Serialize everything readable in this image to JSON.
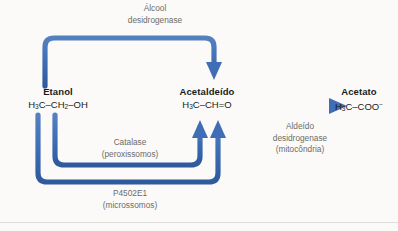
{
  "diagram": {
    "title_alt": "Vias metabolicas do etanol",
    "accent_color": "#3f6eb5",
    "text_color": "#1a1a1a",
    "label_color": "#6d6c68",
    "background_color": "#fbfaf8"
  },
  "nodes": {
    "etanol": {
      "name": "Etanol",
      "formula_parts": [
        "H",
        "3",
        "C–CH",
        "2",
        "–OH"
      ]
    },
    "acetaldeido": {
      "name": "Acetaldeído",
      "formula_parts": [
        "H",
        "3",
        "C–CH=O",
        "",
        ""
      ]
    },
    "acetato": {
      "name": "Acetato",
      "formula_parts": [
        "H",
        "3",
        "C–COO",
        "",
        "−"
      ]
    }
  },
  "enzymes": {
    "alcohol_dehydrogenase": {
      "line1": "Álcool",
      "line2": "desidrogenase",
      "line3": ""
    },
    "catalase": {
      "line1": "Catalase",
      "line2": "(peroxissomos)",
      "line3": ""
    },
    "p4502e1": {
      "line1": "P4502E1",
      "line2": "(microssomos)",
      "line3": ""
    },
    "aldehyde_dehydrogenase": {
      "line1": "Aldeído",
      "line2": "desidrogenase",
      "line3": "(mitocôndria)"
    }
  },
  "arrows": [
    {
      "id": "adh-top-arrow",
      "from": "etanol",
      "to": "acetaldeido",
      "route": "over-the-top"
    },
    {
      "id": "catalase-arrow",
      "from": "etanol",
      "to": "acetaldeido",
      "route": "under-inner"
    },
    {
      "id": "p4502e1-arrow",
      "from": "etanol",
      "to": "acetaldeido",
      "route": "under-outer"
    },
    {
      "id": "aldh-arrow",
      "from": "acetaldeido",
      "to": "acetato",
      "route": "straight"
    }
  ]
}
